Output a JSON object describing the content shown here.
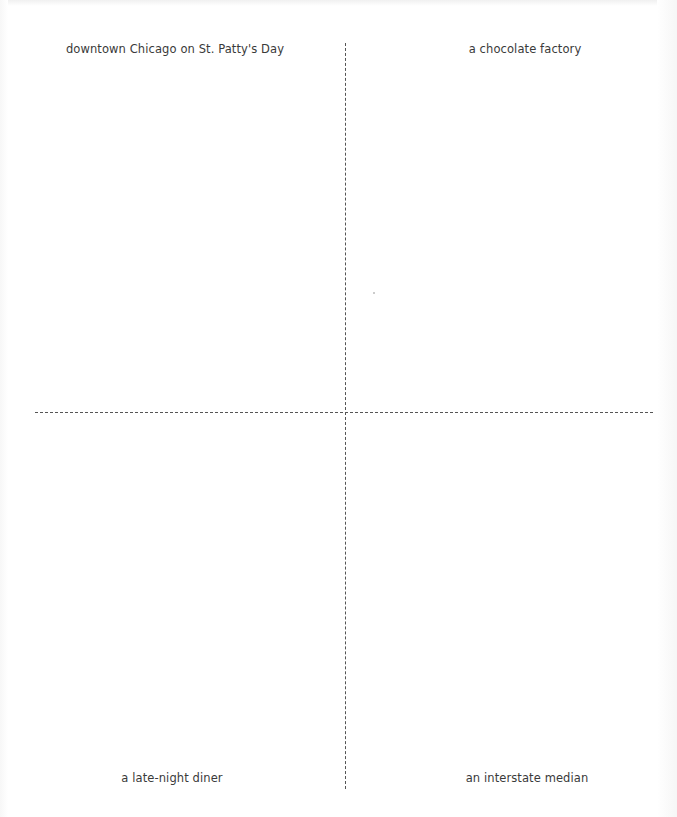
{
  "worksheet": {
    "quadrants": [
      {
        "position": "top-left",
        "label": "downtown Chicago on St. Patty's Day"
      },
      {
        "position": "top-right",
        "label": "a chocolate factory"
      },
      {
        "position": "bottom-left",
        "label": "a late-night diner"
      },
      {
        "position": "bottom-right",
        "label": "an interstate median"
      }
    ],
    "colors": {
      "text": "#3a3a3a",
      "divider": "#555555",
      "background": "#ffffff"
    }
  }
}
